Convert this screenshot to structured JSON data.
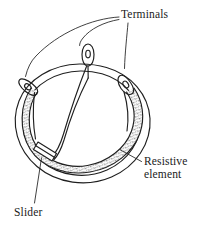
{
  "figure": {
    "kind": "technical-line-diagram",
    "background_color": "#ffffff",
    "ink_color": "#1f1f1f",
    "stipple_color": "#3a3a3a",
    "labels": {
      "terminals": "Terminals",
      "resistive_line1": "Resistive",
      "resistive_line2": "element",
      "slider": "Slider"
    },
    "parts": [
      {
        "name": "housing-outer-circle",
        "description": "large outer circular body of the potentiometer"
      },
      {
        "name": "housing-inner-ring",
        "description": "inner concentric ring inside the housing"
      },
      {
        "name": "resistive-element-track",
        "description": "stippled arc band forming the resistance track"
      },
      {
        "name": "terminal-lug-left",
        "description": "solder lug with eyelet hole at upper left, angled down-left"
      },
      {
        "name": "terminal-lug-top",
        "description": "solder lug with eyelet hole at top centre, vertical"
      },
      {
        "name": "terminal-lug-right",
        "description": "solder lug with eyelet hole at upper right, angled up-right"
      },
      {
        "name": "slider-wiper",
        "description": "small rectangular contact block straddling the track at lower left"
      },
      {
        "name": "wiper-arm",
        "description": "curved arm running from top terminal through interior to slider"
      }
    ],
    "leader_lines": [
      {
        "name": "leader-terminals-to-left-lug"
      },
      {
        "name": "leader-terminals-to-top-lug"
      },
      {
        "name": "leader-terminals-to-right-lug"
      },
      {
        "name": "leader-resistive-to-track"
      },
      {
        "name": "leader-slider-to-wiper"
      }
    ]
  }
}
